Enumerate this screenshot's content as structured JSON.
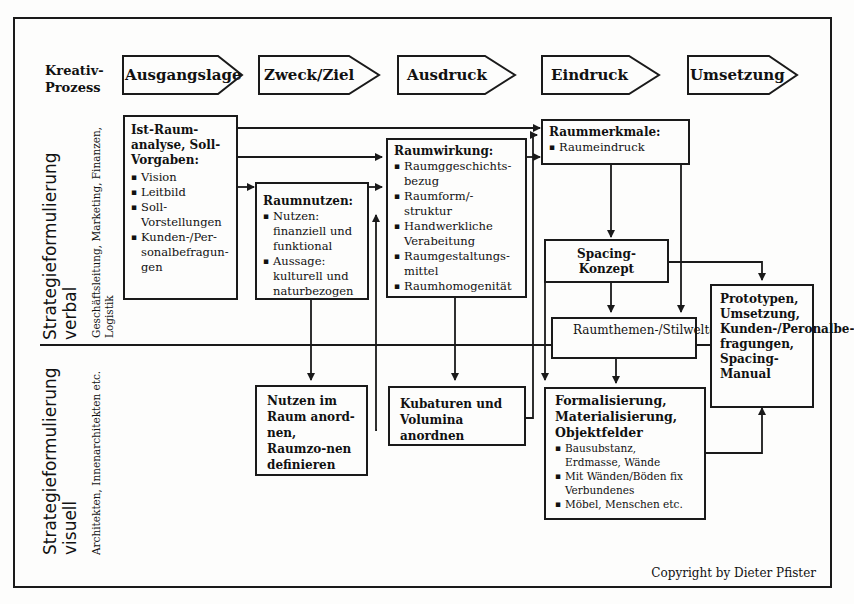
{
  "process": {
    "label_line1": "Kreativ-",
    "label_line2": "Prozess",
    "steps": [
      "Ausgangslage",
      "Zweck/Ziel",
      "Ausdruck",
      "Eindruck",
      "Umsetzung"
    ]
  },
  "rows": {
    "verbal": {
      "title_line1": "Strategieformulierung",
      "title_line2": "verbal",
      "sub_line1": "Geschäftsleitung, Marketing, Finanzen,",
      "sub_line2": "Logistik"
    },
    "visuell": {
      "title_line1": "Strategieformulierung",
      "title_line2": "visuell",
      "sub_line1": "Architekten, Innenarchitekten etc."
    }
  },
  "boxes": {
    "ist_raum": {
      "title": "Ist-Raum-analyse, Soll-Vorgaben:",
      "items": [
        "Vision",
        "Leitbild",
        "Soll-Vorstellungen",
        "Kunden-/Per-sonalbefragun-gen"
      ]
    },
    "raumnutzen": {
      "title": "Raumnutzen:",
      "items": [
        "Nutzen: finanziell und funktional",
        "Aussage: kulturell und naturbezogen"
      ]
    },
    "raumwirkung": {
      "title": "Raumwirkung:",
      "items": [
        "Raumggeschichts-bezug",
        "Raumform/-struktur",
        "Handwerkliche Verabeitung",
        "Raumgestaltungs-mittel",
        "Raumhomogenität"
      ]
    },
    "raummerkmale": {
      "title": "Raummerkmale:",
      "items": [
        "Raumeindruck"
      ]
    },
    "spacing_konzept": {
      "text": "Spacing-Konzept"
    },
    "raumthemen": {
      "text": "Raumthemen-/Stilweltcollagen"
    },
    "prototypen": {
      "text": "Prototypen, Umsetzung, Kunden-/Peronalbe-fragungen, Spacing-Manual"
    },
    "nutzen_im_raum": {
      "text": "Nutzen im Raum anord-nen, Raumzo-nen definieren"
    },
    "kubaturen": {
      "text": "Kubaturen und Volumina anordnen"
    },
    "formalisierung": {
      "title": "Formalisierung, Materialisierung, Objektfelder",
      "items": [
        "Bausubstanz, Erdmasse, Wände",
        "Mit Wänden/Böden fix Verbundenes",
        "Möbel, Menschen etc."
      ]
    }
  },
  "copyright": "Copyright by Dieter Pfister"
}
